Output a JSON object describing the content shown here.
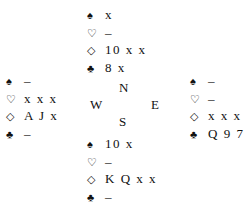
{
  "suits": {
    "spade": "♠",
    "heart": "♡",
    "diamond": "◇",
    "club": "♣"
  },
  "compass": {
    "north": "N",
    "west": "W",
    "east": "E",
    "south": "S"
  },
  "hands": {
    "north": {
      "spades": "x",
      "hearts": "–",
      "diamonds": "10 x x",
      "clubs": "8 x"
    },
    "west": {
      "spades": "–",
      "hearts": "x x x",
      "diamonds": "A J x",
      "clubs": "–"
    },
    "east": {
      "spades": "–",
      "hearts": "–",
      "diamonds": "x x x",
      "clubs": "Q 9 7"
    },
    "south": {
      "spades": "10 x",
      "hearts": "–",
      "diamonds": "K Q x x",
      "clubs": "–"
    }
  }
}
